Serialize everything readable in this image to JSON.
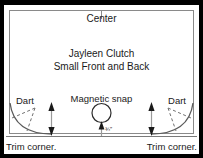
{
  "diagram": {
    "center_mark": {
      "label": "Center"
    },
    "pattern_name": {
      "line1": "Jayleen Clutch",
      "line2": "Small Front and Back"
    },
    "darts": [
      {
        "label": "Dart",
        "side": "left"
      },
      {
        "label": "Dart",
        "side": "right"
      }
    ],
    "hardware": {
      "label": "Magnetic snap",
      "measurement": "¾″"
    },
    "trim_notes": [
      {
        "label": "Trim corner.",
        "side": "left"
      },
      {
        "label": "Trim corner.",
        "side": "right"
      }
    ],
    "colors": {
      "border": "#000000",
      "paper": "#ffffff",
      "line": "#8a8a8a",
      "ink": "#1a1a1a",
      "dashed": "#6f6f6f"
    }
  }
}
